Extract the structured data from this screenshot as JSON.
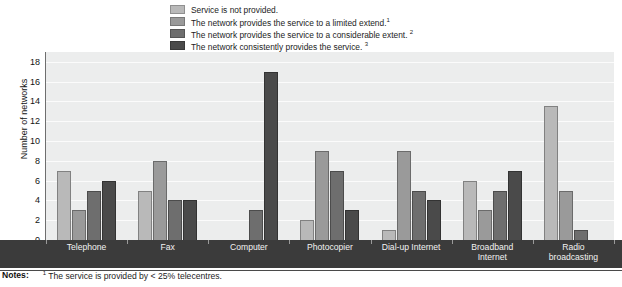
{
  "legend": {
    "position": "top",
    "items": [
      {
        "label": "Service is not provided.",
        "sup": "",
        "color": "#b9b9b9"
      },
      {
        "label": "The network provides the service to a limited extend.",
        "sup": "1",
        "color": "#9a9a9a"
      },
      {
        "label": "The network provides the service to a considerable extent. ",
        "sup": "2",
        "color": "#6e6e6e"
      },
      {
        "label": "The network consistently provides the service. ",
        "sup": "3",
        "color": "#4a4a4a"
      }
    ]
  },
  "axes": {
    "ylabel": "Number of networks",
    "yticks": [
      "0",
      "2",
      "4",
      "6",
      "8",
      "10",
      "12",
      "14",
      "16",
      "18"
    ],
    "xlabel": ""
  },
  "notes": {
    "label": "Notes:",
    "sup": "1",
    "text": " The service is provided by < 25% telecentres."
  },
  "chart_data": {
    "type": "bar",
    "title": "",
    "subtitle": "",
    "xlabel": "",
    "ylabel": "Number of networks",
    "ylim": [
      0,
      19
    ],
    "yticks": [
      0,
      2,
      4,
      6,
      8,
      10,
      12,
      14,
      16,
      18
    ],
    "grid": true,
    "legend_position": "top",
    "categories": [
      "Telephone",
      "Fax",
      "Computer",
      "Photocopier",
      "Dial-up Internet",
      "Broadband Internet",
      "Radio broadcasting"
    ],
    "category_lines": [
      [
        "Telephone"
      ],
      [
        "Fax"
      ],
      [
        "Computer"
      ],
      [
        "Photocopier"
      ],
      [
        "Dial-up Internet"
      ],
      [
        "Broadband",
        "Internet"
      ],
      [
        "Radio",
        "broadcasting"
      ]
    ],
    "series": [
      {
        "name": "Service is not provided.",
        "color": "#b9b9b9",
        "values": [
          7,
          5,
          0,
          2,
          1,
          6,
          13.5
        ]
      },
      {
        "name": "The network provides the service to a limited extend.",
        "color": "#9a9a9a",
        "values": [
          3,
          8,
          0,
          9,
          9,
          3,
          5
        ]
      },
      {
        "name": "The network provides the service to a considerable extent.",
        "color": "#6e6e6e",
        "values": [
          5,
          4,
          3,
          7,
          5,
          5,
          1
        ]
      },
      {
        "name": "The network consistently provides the service.",
        "color": "#4a4a4a",
        "values": [
          6,
          4,
          17,
          3,
          4,
          7,
          0
        ]
      }
    ]
  },
  "colors": {
    "plot_background": "#eceded",
    "gridline": "#fbfbfb",
    "axis_band": "#3b3b3b",
    "axis_line": "#6e6e6e"
  }
}
